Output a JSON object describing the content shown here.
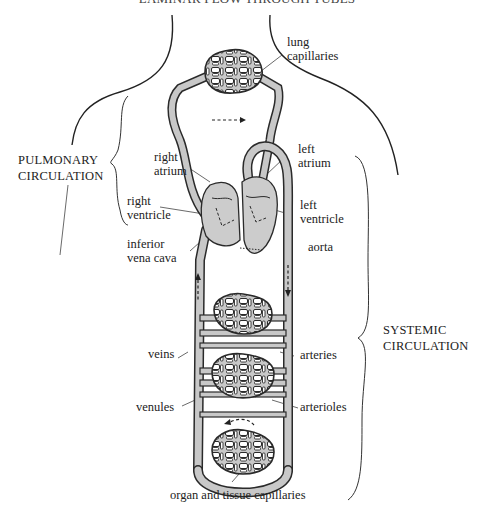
{
  "header": {
    "text": "LAMINAR FLOW THROUGH TUBES"
  },
  "diagram": {
    "colors": {
      "vessel_fill": "#c8c8c8",
      "heart_fill": "#cccccc",
      "stroke": "#2a2a2a",
      "background": "#ffffff"
    },
    "brackets": {
      "pulmonary": {
        "line1": "PULMONARY",
        "line2": "CIRCULATION"
      },
      "systemic": {
        "line1": "SYSTEMIC",
        "line2": "CIRCULATION"
      }
    },
    "labels": {
      "lung_capillaries": {
        "line1": "lung",
        "line2": "capillaries"
      },
      "right_atrium": {
        "line1": "right",
        "line2": "atrium"
      },
      "right_ventricle": {
        "line1": "right",
        "line2": "ventricle"
      },
      "left_atrium": {
        "line1": "left",
        "line2": "atrium"
      },
      "left_ventricle": {
        "line1": "left",
        "line2": "ventricle"
      },
      "inferior_vena_cava": {
        "line1": "inferior",
        "line2": "vena cava"
      },
      "aorta": "aorta",
      "veins": "veins",
      "arteries": "arteries",
      "venules": "venules",
      "arterioles": "arterioles",
      "organ_capillaries": "organ and tissue capillaries"
    }
  }
}
